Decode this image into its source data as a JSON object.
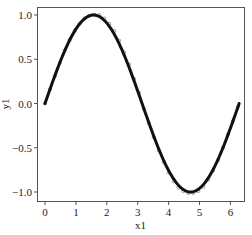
{
  "chart_data": {
    "type": "line",
    "title": "",
    "xlabel": "x1",
    "ylabel": "y1",
    "xlim": [
      -0.26,
      6.45
    ],
    "ylim": [
      -1.1,
      1.1
    ],
    "xticks": [
      0,
      1,
      2,
      3,
      4,
      5,
      6
    ],
    "xtick_labels": [
      "0",
      "1",
      "2",
      "3",
      "4",
      "5",
      "6"
    ],
    "yticks": [
      1.0,
      0.5,
      0.0,
      -0.5,
      -1.0
    ],
    "ytick_labels": [
      "1.0",
      "0.5",
      "0.0",
      "-0.5",
      "-1.0"
    ],
    "grid": false,
    "legend": null,
    "series": [
      {
        "name": "fit",
        "kind": "line",
        "function": "sin(x)",
        "x_range": [
          0,
          6.2832
        ],
        "color": "#111111",
        "line_width": 3
      },
      {
        "name": "observations",
        "kind": "scatter",
        "marker": "open-circle",
        "color": "#888888",
        "points": [
          [
            0.0,
            0.0
          ],
          [
            0.16,
            0.16
          ],
          [
            0.32,
            0.31
          ],
          [
            0.48,
            0.46
          ],
          [
            0.64,
            0.6
          ],
          [
            0.8,
            0.72
          ],
          [
            0.96,
            0.82
          ],
          [
            1.12,
            0.9
          ],
          [
            1.28,
            0.96
          ],
          [
            1.44,
            0.99
          ],
          [
            1.6,
            1.0
          ],
          [
            1.76,
            1.0
          ],
          [
            1.92,
            0.96
          ],
          [
            2.08,
            0.9
          ],
          [
            2.24,
            0.82
          ],
          [
            2.4,
            0.71
          ],
          [
            2.56,
            0.58
          ],
          [
            2.72,
            0.44
          ],
          [
            2.88,
            0.28
          ],
          [
            3.04,
            0.12
          ],
          [
            3.2,
            -0.06
          ],
          [
            3.36,
            -0.22
          ],
          [
            3.52,
            -0.38
          ],
          [
            3.68,
            -0.53
          ],
          [
            3.84,
            -0.66
          ],
          [
            4.0,
            -0.78
          ],
          [
            4.16,
            -0.88
          ],
          [
            4.32,
            -0.95
          ],
          [
            4.48,
            -0.99
          ],
          [
            4.64,
            -1.01
          ],
          [
            4.8,
            -1.01
          ],
          [
            4.96,
            -0.99
          ],
          [
            5.12,
            -0.94
          ],
          [
            5.28,
            -0.86
          ],
          [
            5.44,
            -0.76
          ],
          [
            5.6,
            -0.64
          ],
          [
            5.76,
            -0.5
          ],
          [
            5.92,
            -0.35
          ],
          [
            6.08,
            -0.2
          ],
          [
            6.24,
            -0.04
          ]
        ]
      }
    ]
  },
  "layout": {
    "plot_left": 37,
    "plot_top": 7,
    "plot_right": 244,
    "plot_bottom": 201,
    "x0_px": 45,
    "x_px_per_unit": 30.9,
    "y0_px": 103.5,
    "y_px_per_unit": 88.5
  }
}
